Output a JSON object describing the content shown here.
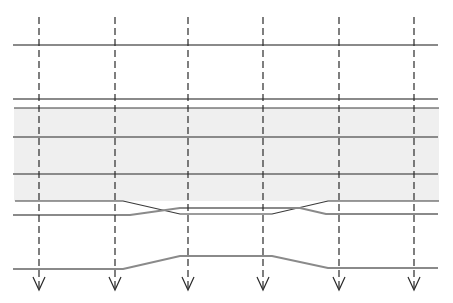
{
  "diagram": {
    "width": 453,
    "height": 303,
    "colors": {
      "background": "#ffffff",
      "band_fill": "#efefef",
      "gray_line": "#8a8a8a",
      "dark_line": "#3a3a3a",
      "dashed_line": "#2a2a2a"
    },
    "band": {
      "x": 14,
      "y": 108,
      "width": 425,
      "height": 93
    },
    "horizontal_lines": [
      {
        "name": "line-top",
        "y": 45,
        "x1": 13,
        "x2": 438,
        "style": "gray"
      },
      {
        "name": "line-band-upper-gray",
        "y": 99,
        "x1": 13,
        "x2": 438,
        "style": "gray"
      },
      {
        "name": "line-band-top",
        "y": 108,
        "x1": 14,
        "x2": 439,
        "style": "dark"
      },
      {
        "name": "line-band-middle-1",
        "y": 137,
        "x1": 13,
        "x2": 438,
        "style": "gray"
      },
      {
        "name": "line-band-middle-2",
        "y": 174,
        "x1": 13,
        "x2": 438,
        "style": "gray"
      }
    ],
    "paths": [
      {
        "name": "band-bottom-converging-dark",
        "style": "dark",
        "points": "15,201 123,201 180,214 272,214 328,201 439,201"
      },
      {
        "name": "band-bottom-converging-gray",
        "style": "gray",
        "points": "13,215 130,215 180,208 300,208 326,214 438,214"
      },
      {
        "name": "bottom-bulge-gray",
        "style": "gray",
        "points": "13,269 123,269 180,256 272,256 328,268 438,268"
      }
    ],
    "arrows": [
      {
        "name": "arrow-1",
        "x": 39,
        "y1": 17,
        "y2": 290
      },
      {
        "name": "arrow-2",
        "x": 115,
        "y1": 17,
        "y2": 290
      },
      {
        "name": "arrow-3",
        "x": 188,
        "y1": 17,
        "y2": 290
      },
      {
        "name": "arrow-4",
        "x": 263,
        "y1": 17,
        "y2": 290
      },
      {
        "name": "arrow-5",
        "x": 339,
        "y1": 17,
        "y2": 290
      },
      {
        "name": "arrow-6",
        "x": 414,
        "y1": 17,
        "y2": 290
      }
    ]
  }
}
